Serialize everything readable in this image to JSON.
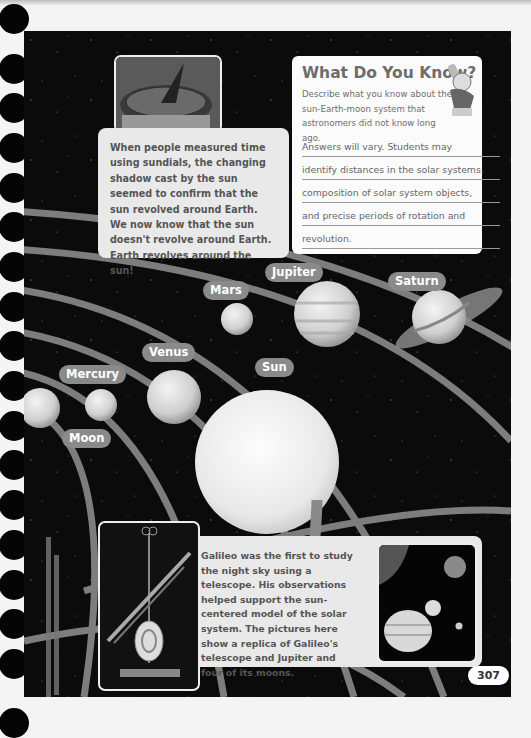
{
  "page": {
    "number": "307",
    "background_color": "#0b0b0b",
    "orbit_color": "#7d7d7d",
    "label_color": "#8a8a8a"
  },
  "sundial_card": {
    "image": "sundial-photo",
    "text": "When people measured time using sundials, the changing shadow cast by the sun seemed to confirm that the sun revolved around Earth. We now know that the sun doesn't revolve around Earth. Earth revolves around the sun!"
  },
  "what_do_you_know": {
    "title": "What Do You Know?",
    "prompt": "Describe what you know about the sun-Earth-moon system that astronomers did not know long ago.",
    "answer_lines": [
      "Answers will vary. Students may",
      "identify distances in the solar systems,",
      "composition of solar system objects,",
      "and precise periods of rotation and",
      "revolution."
    ],
    "mascot": "cartoon-character-with-telescope"
  },
  "planet_labels": {
    "mercury": "Mercury",
    "venus": "Venus",
    "moon": "Moon",
    "mars": "Mars",
    "jupiter": "Jupiter",
    "saturn": "Saturn",
    "sun": "Sun"
  },
  "galileo_card": {
    "telescope_image": "galileo-telescope-replica-photo",
    "jupiter_image": "jupiter-and-four-moons-photo",
    "text": "Galileo was the first to study the night sky using a telescope. His observations helped support the sun-centered model of the solar system. The pictures here show a replica of Galileo's telescope and Jupiter and four of its moons."
  }
}
